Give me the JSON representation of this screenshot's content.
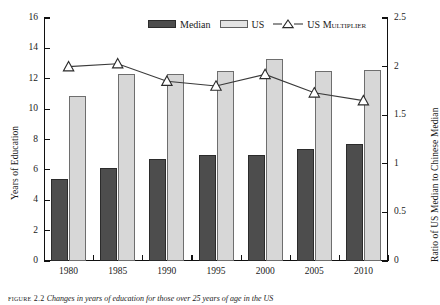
{
  "chart_data": {
    "type": "bar",
    "title": "",
    "subtitle": "",
    "categories": [
      "1980",
      "1985",
      "1990",
      "1995",
      "2000",
      "2005",
      "2010"
    ],
    "xlabel": "",
    "ylabel": "Years of Education",
    "ylabel_right": "Ratio of US Median to Chinese Median",
    "ylim": [
      0,
      16
    ],
    "ylim_right": [
      0,
      2.5
    ],
    "yticks": [
      "0",
      "2",
      "4",
      "6",
      "8",
      "10",
      "12",
      "14",
      "16"
    ],
    "ytick_values": [
      0,
      2,
      4,
      6,
      8,
      10,
      12,
      14,
      16
    ],
    "yticks_right": [
      "0",
      "0.5",
      "1",
      "1.5",
      "2",
      "2.5"
    ],
    "ytick_values_right": [
      0,
      0.5,
      1,
      1.5,
      2,
      2.5
    ],
    "grid": false,
    "legend_position": "top-center",
    "series": [
      {
        "name": "Median",
        "kind": "bar",
        "axis": "left",
        "color": "#4d4d4d",
        "values": [
          5.4,
          6.1,
          6.7,
          7.0,
          7.0,
          7.4,
          7.7
        ]
      },
      {
        "name": "US",
        "kind": "bar",
        "axis": "left",
        "color": "#d7d7d7",
        "values": [
          10.85,
          12.3,
          12.3,
          12.5,
          13.3,
          12.5,
          12.55
        ]
      },
      {
        "name": "US Multiplier",
        "kind": "line",
        "axis": "right",
        "color": "#3a3a3a",
        "marker": "triangle-up",
        "values": [
          2.0,
          2.03,
          1.85,
          1.8,
          1.92,
          1.73,
          1.65
        ]
      }
    ]
  },
  "legend": {
    "items": [
      {
        "label": "Median",
        "icon": "filled-dark-bar-swatch"
      },
      {
        "label": "US",
        "icon": "filled-light-bar-swatch"
      },
      {
        "label": "US Multiplier",
        "icon": "line-with-triangle-marker"
      }
    ]
  },
  "caption": {
    "figure_label": "figure 2.2",
    "text": "Changes in years of education for those over 25 years of age in the US"
  },
  "colors": {
    "median_bar": "#4d4d4d",
    "us_bar": "#d7d7d7",
    "line": "#3a3a3a",
    "axis": "#111111",
    "background": "#ffffff"
  }
}
